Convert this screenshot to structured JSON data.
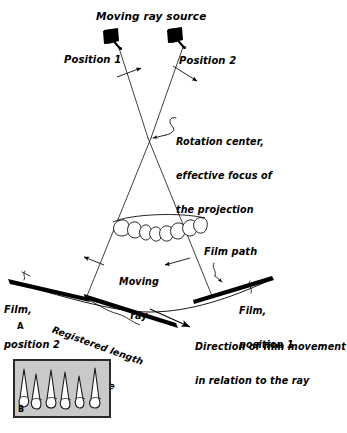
{
  "figure": {
    "title_label": "Moving ray source",
    "panel_a_letter": "A",
    "panel_b_letter": "B",
    "labels": {
      "position_1": "Position 1",
      "position_2": "Position 2",
      "rotation_center_line1": "Rotation center,",
      "rotation_center_line2": "effective focus of",
      "rotation_center_line3": "the projection",
      "moving_ray_line1": "Moving",
      "moving_ray_line2": "ray",
      "film_path": "Film path",
      "film_position_1_line1": "Film,",
      "film_position_1_line2": "position 1",
      "film_position_2_line1": "Film,",
      "film_position_2_line2": "position 2",
      "registered_length_line1": "Registered length",
      "registered_length_line2": "of the image",
      "direction_line1": "Direction of film movement",
      "direction_line2": "in relation to the ray"
    },
    "colors": {
      "ink": "#000000",
      "panel_b_fill": "#c9c9c9",
      "panel_b_border": "#2a2a2a",
      "tooth_fill": "#ffffff",
      "page_background": "#ffffff"
    },
    "icons": {
      "tube_head_1": "x-ray-tube-head-icon",
      "tube_head_2": "x-ray-tube-head-icon",
      "dental_arch": "dental-arch-icon",
      "radiograph": "panoramic-radiograph-icon"
    }
  }
}
